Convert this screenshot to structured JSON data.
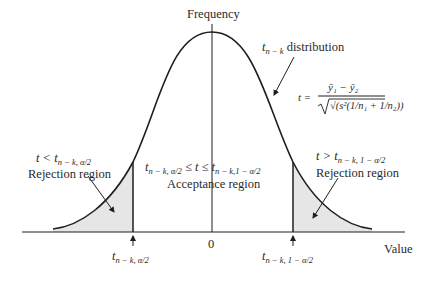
{
  "diagram": {
    "y_axis_label": "Frequency",
    "x_axis_label": "Value",
    "zero_label": "0",
    "distribution_label": {
      "var": "t",
      "sub": "n − k",
      "text": "distribution"
    },
    "formula": {
      "lhs": "t =",
      "numerator": "ȳ₁ − ȳ₂",
      "denominator": "√(s²(1/n₁ + 1/n₂))"
    },
    "left_region": {
      "condition_var": "t <",
      "condition_t": "t",
      "condition_sub": "n − k, α/2",
      "name": "Rejection region"
    },
    "center_region": {
      "cond_left_t": "t",
      "cond_left_sub": "n − k, α/2",
      "cond_mid": "≤ t ≤",
      "cond_right_t": "t",
      "cond_right_sub": "n − k,1 − α/2",
      "name": "Acceptance region"
    },
    "right_region": {
      "condition_var": "t >",
      "condition_t": "t",
      "condition_sub": "n − k, 1 − α/2",
      "name": "Rejection region"
    },
    "left_tick": {
      "t": "t",
      "sub": "n − k, α/2"
    },
    "right_tick": {
      "t": "t",
      "sub": "n − k, 1 − α/2"
    },
    "colors": {
      "line": "#1e1e1e",
      "shade": "#e6e6e6",
      "text": "#2a2a2a"
    }
  }
}
